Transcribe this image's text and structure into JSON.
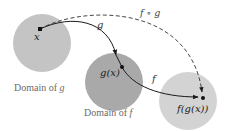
{
  "diagram": {
    "colors": {
      "domain_g_fill": "#c4c4c4",
      "domain_f_fill": "#a9a9a9",
      "codomain_fill": "#d3d3d3",
      "arrow": "#1a1a1a",
      "caption_text": "#6b6b6b",
      "label_text": "#222222"
    },
    "regions": [
      {
        "id": "domain-of-g",
        "caption": "Domain of g",
        "caption_prefix": "Domain of ",
        "caption_var": "g"
      },
      {
        "id": "domain-of-f",
        "caption": "Domain of f",
        "caption_prefix": "Domain of ",
        "caption_var": "f"
      },
      {
        "id": "range",
        "caption": ""
      }
    ],
    "points": {
      "x": "x",
      "gx": "g(x)",
      "fgx": "f(g(x))"
    },
    "arrows": {
      "g": "g",
      "f": "f",
      "composite": "f ∘ g"
    }
  }
}
